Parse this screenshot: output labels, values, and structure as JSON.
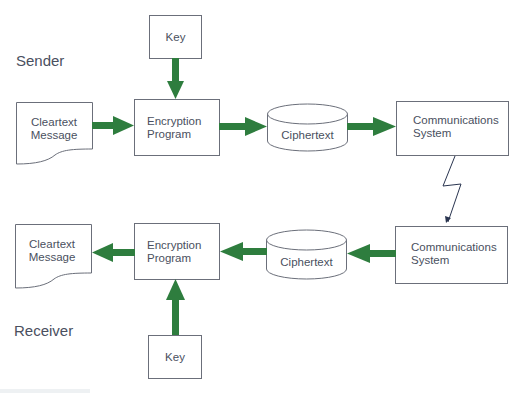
{
  "diagram": {
    "title_partial": "",
    "colors": {
      "arrow": "#2e7d3e",
      "stroke": "#6b6f7a",
      "text": "#4a5060",
      "bolt": "#2a3550"
    },
    "roles": {
      "sender": "Sender",
      "receiver": "Receiver"
    },
    "sender": {
      "key": {
        "label": "Key"
      },
      "cleartext": {
        "line1": "Cleartext",
        "line2": "Message"
      },
      "encryption": {
        "line1": "Encryption",
        "line2": "Program"
      },
      "ciphertext": {
        "label": "Ciphertext"
      },
      "comms": {
        "line1": "Communications",
        "line2": "System"
      }
    },
    "receiver": {
      "key": {
        "label": "Key"
      },
      "cleartext": {
        "line1": "Cleartext",
        "line2": "Message"
      },
      "encryption": {
        "line1": "Encryption",
        "line2": "Program"
      },
      "ciphertext": {
        "label": "Ciphertext"
      },
      "comms": {
        "line1": "Communications",
        "line2": "System"
      }
    },
    "edges": [
      {
        "from": "sender.key",
        "to": "sender.encryption"
      },
      {
        "from": "sender.cleartext",
        "to": "sender.encryption"
      },
      {
        "from": "sender.encryption",
        "to": "sender.ciphertext"
      },
      {
        "from": "sender.ciphertext",
        "to": "sender.comms"
      },
      {
        "from": "sender.comms",
        "to": "receiver.comms",
        "style": "lightning"
      },
      {
        "from": "receiver.comms",
        "to": "receiver.ciphertext"
      },
      {
        "from": "receiver.ciphertext",
        "to": "receiver.encryption"
      },
      {
        "from": "receiver.encryption",
        "to": "receiver.cleartext"
      },
      {
        "from": "receiver.key",
        "to": "receiver.encryption"
      }
    ]
  }
}
